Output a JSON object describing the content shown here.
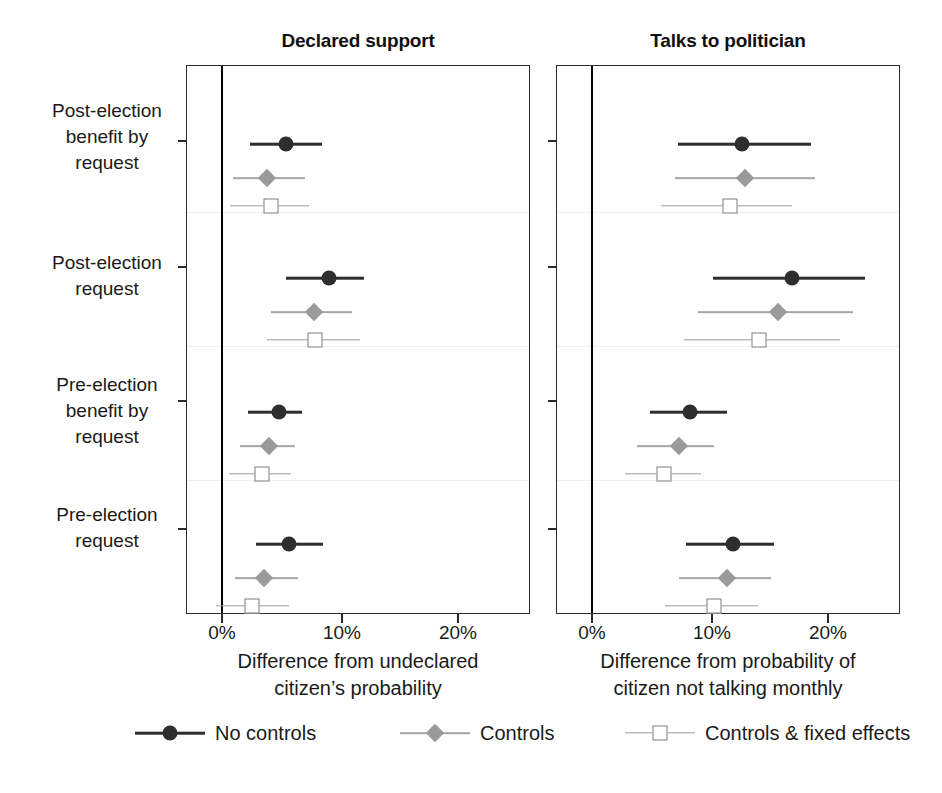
{
  "chart_data": {
    "type": "scatter",
    "plot_style": "coefficient-plot-with-confidence-intervals",
    "title": "",
    "panels": [
      {
        "title": "Declared support",
        "xlabel": "Difference from undeclared citizen’s probability",
        "xlabel_line1": "Difference from undeclared",
        "xlabel_line2": "citizen’s probability",
        "xticklabels": [
          "0%",
          "10%",
          "20%"
        ],
        "xticks": [
          0,
          10,
          20
        ],
        "xlim": [
          -3,
          26
        ],
        "series": [
          {
            "name": "No controls",
            "values": [
              5.6,
              9.3,
              5.0,
              5.9
            ],
            "ci_low": [
              2.5,
              5.6,
              2.3,
              3.0
            ],
            "ci_high": [
              8.7,
              12.3,
              7.0,
              8.8
            ]
          },
          {
            "name": "Controls",
            "values": [
              4.0,
              8.0,
              4.1,
              3.7
            ],
            "ci_low": [
              1.0,
              4.3,
              1.6,
              1.2
            ],
            "ci_high": [
              7.2,
              11.3,
              6.4,
              6.6
            ]
          },
          {
            "name": "Controls & fixed effects",
            "values": [
              4.3,
              8.1,
              3.5,
              2.7
            ],
            "ci_low": [
              0.8,
              4.0,
              0.7,
              -0.4
            ],
            "ci_high": [
              7.6,
              12.0,
              6.0,
              5.9
            ]
          }
        ]
      },
      {
        "title": "Talks to politician",
        "xlabel": "Difference from probability of citizen not talking monthly",
        "xlabel_line1": "Difference from probability of",
        "xlabel_line2": "citizen not talking monthly",
        "xticklabels": [
          "0%",
          "10%",
          "20%"
        ],
        "xticks": [
          0,
          10,
          20
        ],
        "xlim": [
          -3,
          26
        ],
        "series": [
          {
            "name": "No controls",
            "values": [
              13.0,
              17.3,
              8.5,
              12.2
            ],
            "ci_low": [
              7.5,
              10.5,
              5.1,
              8.2
            ],
            "ci_high": [
              19.0,
              23.6,
              11.7,
              15.8
            ]
          },
          {
            "name": "Controls",
            "values": [
              13.3,
              16.1,
              7.6,
              11.7
            ],
            "ci_low": [
              7.2,
              9.2,
              4.0,
              7.6
            ],
            "ci_high": [
              19.3,
              22.6,
              10.6,
              15.5
            ]
          },
          {
            "name": "Controls & fixed effects",
            "values": [
              12.0,
              14.5,
              6.3,
              10.6
            ],
            "ci_low": [
              6.0,
              8.0,
              2.9,
              6.4
            ],
            "ci_high": [
              17.3,
              21.5,
              9.5,
              14.4
            ]
          }
        ]
      }
    ],
    "categories": [
      "Post-election benefit by request",
      "Post-election request",
      "Pre-election benefit by request",
      "Pre-election request"
    ],
    "category_lines": [
      [
        "Post-election",
        "benefit by",
        "request"
      ],
      [
        "Post-election",
        "request"
      ],
      [
        "Pre-election",
        "benefit by",
        "request"
      ],
      [
        "Pre-election",
        "request"
      ]
    ],
    "ylabel": "",
    "grid": false,
    "legend_position": "bottom",
    "legend": [
      {
        "label": "No controls",
        "marker": "circle",
        "color": "#2e2e2e"
      },
      {
        "label": "Controls",
        "marker": "diamond",
        "color": "#9a9a9a"
      },
      {
        "label": "Controls & fixed effects",
        "marker": "square-open",
        "color": "#7d7d7d"
      }
    ],
    "reference_line": {
      "value": 0,
      "label": "0%",
      "color": "#000000"
    }
  }
}
